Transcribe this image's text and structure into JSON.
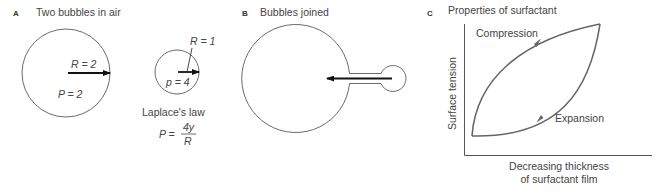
{
  "panels": {
    "a": {
      "letter": "A",
      "title": "Two bubbles in air",
      "large_bubble": {
        "r_label": "R = 2",
        "p_label": "P = 2"
      },
      "small_bubble": {
        "r_label": "R = 1",
        "p_label": "p = 4"
      },
      "law_title": "Laplace's law",
      "law_lhs": "P =",
      "law_num": "4y",
      "law_den": "R"
    },
    "b": {
      "letter": "B",
      "title": "Bubbles joined"
    },
    "c": {
      "letter": "C",
      "title": "Properties of surfactant",
      "y_label": "Surface tension",
      "x_label_line1": "Decreasing thickness",
      "x_label_line2": "of surfactant film",
      "upper_curve_label": "Compression",
      "lower_curve_label": "Expansion"
    }
  },
  "colors": {
    "stroke": "#6b6b6b",
    "arrow": "#111111",
    "text": "#444444"
  }
}
